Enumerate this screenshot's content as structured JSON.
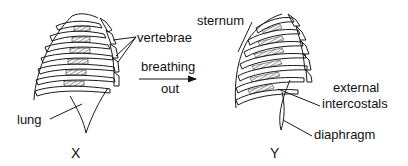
{
  "diagram": {
    "figures": [
      {
        "id": "X",
        "label": "X",
        "state": "before"
      },
      {
        "id": "Y",
        "label": "Y",
        "state": "after"
      }
    ],
    "transition": {
      "line1": "breathing",
      "line2": "out"
    },
    "labels": {
      "vertebrae": "vertebrae",
      "lung": "lung",
      "sternum": "sternum",
      "external_intercostals_1": "external",
      "external_intercostals_2": "intercostals",
      "diaphragm": "diaphragm"
    },
    "colors": {
      "stroke": "#1a1a1a",
      "background": "#ffffff"
    }
  }
}
